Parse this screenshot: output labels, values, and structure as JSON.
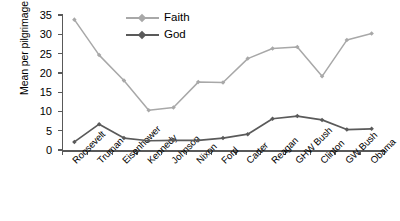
{
  "chart_data": {
    "type": "line",
    "title": "",
    "xlabel": "",
    "ylabel": "Mean per pilgrimage",
    "categories": [
      "Roosevelt",
      "Truman",
      "Eisenhower",
      "Kennedy",
      "Johnson",
      "Nixon",
      "Ford",
      "Carter",
      "Reagan",
      "GHW Bush",
      "Clinton",
      "GW Bush",
      "Obama"
    ],
    "series": [
      {
        "name": "Faith",
        "color": "#a8a8a8",
        "values": [
          33.8,
          24.6,
          18.0,
          10.3,
          11.0,
          17.6,
          17.5,
          23.7,
          26.3,
          26.7,
          19.1,
          28.5,
          30.2
        ]
      },
      {
        "name": "God",
        "color": "#5a5a5a",
        "values": [
          2.1,
          6.7,
          3.1,
          2.4,
          2.5,
          2.5,
          3.1,
          4.1,
          8.1,
          8.8,
          7.8,
          5.3,
          5.5
        ]
      }
    ],
    "ylim": [
      0,
      35
    ],
    "yticks": [
      0,
      5,
      10,
      15,
      20,
      25,
      30,
      35
    ],
    "ytick_labels": [
      "0",
      "5",
      "10",
      "15",
      "20",
      "25",
      "30",
      "35"
    ],
    "grid": false,
    "legend_position": "top-center",
    "legend_entries": [
      "Faith",
      "God"
    ],
    "axis_color": "#595959"
  }
}
